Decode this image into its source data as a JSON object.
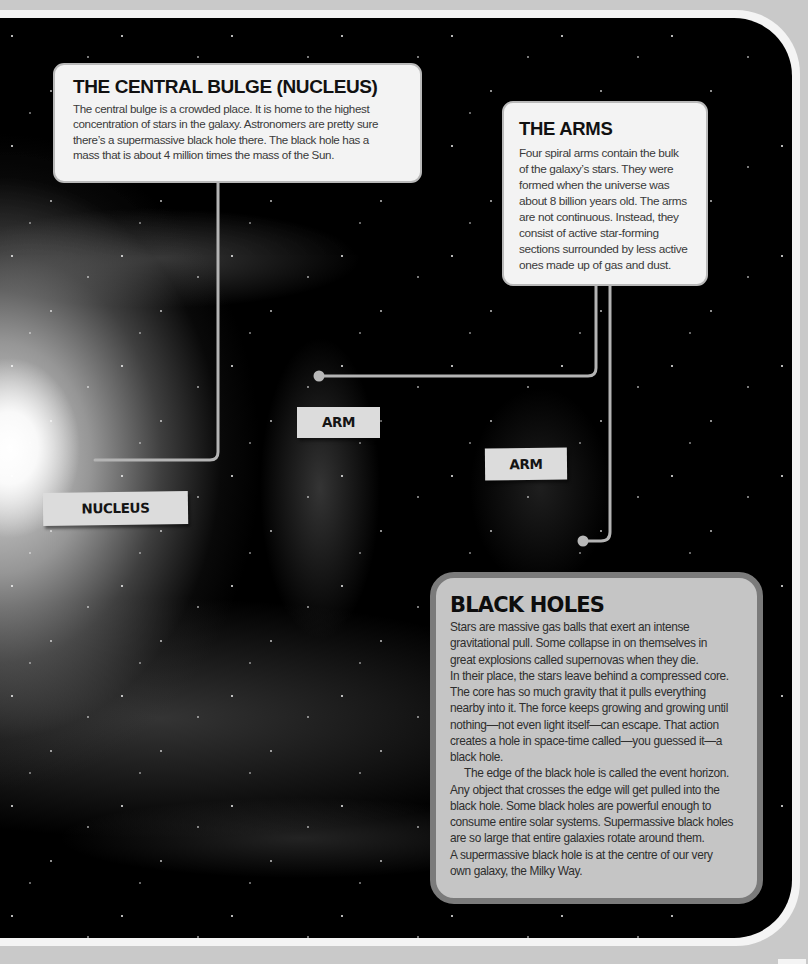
{
  "colors": {
    "page_background": "#c9c9c9",
    "frame_border": "#f4f4f4",
    "panel_background": "#000000",
    "callout_box_fill": "#f3f3f3",
    "black_holes_fill": "#c5c5c5",
    "black_holes_border": "#7b7b7b",
    "connector_line": "#b4b4b4",
    "label_fill": "#dcdcdc"
  },
  "central_bulge": {
    "title": "THE CENTRAL BULGE (NUCLEUS)",
    "lines": [
      "The central bulge is a crowded place. It is home to the highest",
      "concentration of stars in the galaxy. Astronomers are pretty sure",
      "there’s a supermassive black hole there. The black hole has a",
      "mass that is about 4 million times the mass of the Sun."
    ]
  },
  "arms": {
    "title": "THE ARMS",
    "lines": [
      "Four spiral arms contain the bulk",
      "of the galaxy’s stars. They were",
      "formed when the universe was",
      "about 8 billion years old. The arms",
      "are not continuous. Instead, they",
      "consist of active star-forming",
      "sections surrounded by less active",
      "ones made up of gas and dust."
    ]
  },
  "black_holes": {
    "title": "BLACK HOLES",
    "paragraph_1": [
      "Stars are massive gas balls that exert an intense",
      "gravitational pull. Some collapse in on themselves in",
      "great explosions called supernovas when they die.",
      "In their place, the stars leave behind a compressed core.",
      "The core has so much gravity that it pulls everything",
      "nearby into it. The force keeps growing and growing until",
      "nothing—not even light itself—can escape. That action",
      "creates a hole in space-time called—you guessed it—a",
      "black hole."
    ],
    "paragraph_2": [
      "The edge of the black hole is called the event horizon.",
      "Any object that crosses the edge will get pulled into the",
      "black hole. Some black holes are powerful enough to",
      "consume entire solar systems. Supermassive black holes",
      "are so large that entire galaxies rotate around them.",
      "A supermassive black hole is at the centre of our very",
      "own galaxy, the Milky Way."
    ]
  },
  "labels": {
    "nucleus": "NUCLEUS",
    "arm_1": "ARM",
    "arm_2": "ARM"
  }
}
